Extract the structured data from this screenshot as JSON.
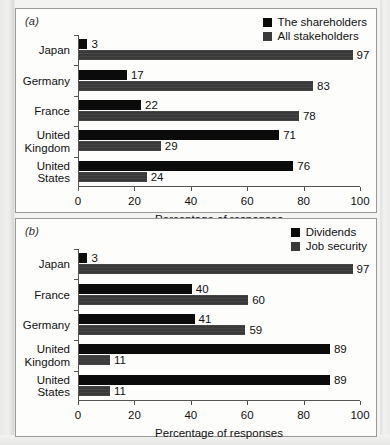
{
  "figure": {
    "panels": [
      {
        "tag": "(a)",
        "legend": [
          {
            "label": "The shareholders",
            "color": "#0b0b0b"
          },
          {
            "label": "All stakeholders",
            "color": "#3a3a3a"
          }
        ],
        "xlabel": "Percentage of responses",
        "xticks": [
          "0",
          "20",
          "40",
          "60",
          "80",
          "100"
        ],
        "categories": [
          "Japan",
          "Germany",
          "France",
          "United Kingdom",
          "United States"
        ],
        "values_series0": [
          "3",
          "17",
          "22",
          "71",
          "76"
        ],
        "values_series1": [
          "97",
          "83",
          "78",
          "29",
          "24"
        ]
      },
      {
        "tag": "(b)",
        "legend": [
          {
            "label": "Dividends",
            "color": "#0b0b0b"
          },
          {
            "label": "Job security",
            "color": "#3a3a3a"
          }
        ],
        "xlabel": "Percentage of responses",
        "xticks": [
          "0",
          "20",
          "40",
          "60",
          "80",
          "100"
        ],
        "categories": [
          "Japan",
          "France",
          "Germany",
          "United Kingdom",
          "United States"
        ],
        "values_series0": [
          "3",
          "40",
          "41",
          "89",
          "89"
        ],
        "values_series1": [
          "97",
          "60",
          "59",
          "11",
          "11"
        ]
      }
    ]
  },
  "chart_data": [
    {
      "type": "bar",
      "orientation": "horizontal",
      "panel": "(a)",
      "title": "",
      "xlabel": "Percentage of responses",
      "ylabel": "",
      "xlim": [
        0,
        100
      ],
      "xticks": [
        0,
        20,
        40,
        60,
        80,
        100
      ],
      "grid": false,
      "legend_position": "top-right",
      "categories": [
        "Japan",
        "Germany",
        "France",
        "United Kingdom",
        "United States"
      ],
      "series": [
        {
          "name": "The shareholders",
          "color": "#0b0b0b",
          "values": [
            3,
            17,
            22,
            71,
            76
          ]
        },
        {
          "name": "All stakeholders",
          "color": "#3a3a3a",
          "values": [
            97,
            83,
            78,
            29,
            24
          ]
        }
      ]
    },
    {
      "type": "bar",
      "orientation": "horizontal",
      "panel": "(b)",
      "title": "",
      "xlabel": "Percentage of responses",
      "ylabel": "",
      "xlim": [
        0,
        100
      ],
      "xticks": [
        0,
        20,
        40,
        60,
        80,
        100
      ],
      "grid": false,
      "legend_position": "top-right",
      "categories": [
        "Japan",
        "France",
        "Germany",
        "United Kingdom",
        "United States"
      ],
      "series": [
        {
          "name": "Dividends",
          "color": "#0b0b0b",
          "values": [
            3,
            40,
            41,
            89,
            89
          ]
        },
        {
          "name": "Job security",
          "color": "#3a3a3a",
          "values": [
            97,
            60,
            59,
            11,
            11
          ]
        }
      ]
    }
  ]
}
